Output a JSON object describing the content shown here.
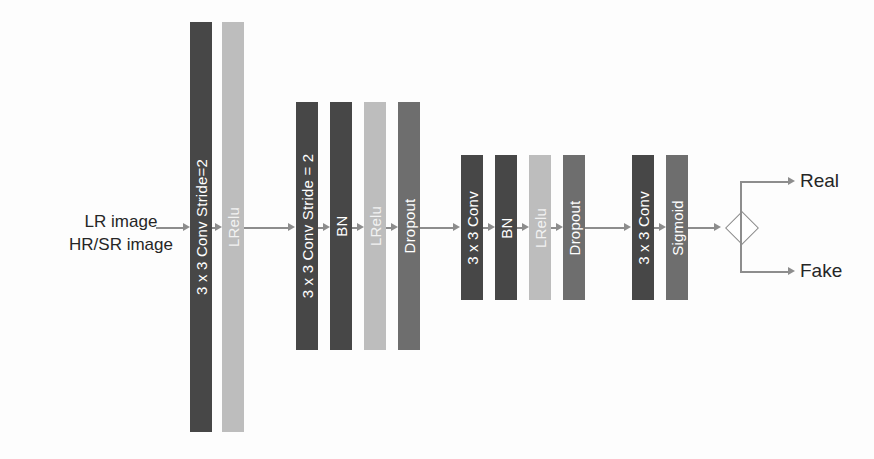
{
  "diagram": {
    "input": {
      "line1": "LR image",
      "line2": "HR/SR image"
    },
    "groups": [
      {
        "name": "group-1",
        "layers": [
          {
            "label": "3 x 3 Conv Stride=2",
            "tone": "dark",
            "color": "#474747",
            "x": 190,
            "y": 22,
            "w": 22,
            "h": 410
          },
          {
            "label": "LRelu",
            "tone": "light",
            "color": "#bdbdbd",
            "x": 222,
            "y": 22,
            "w": 22,
            "h": 410
          }
        ]
      },
      {
        "name": "group-2",
        "layers": [
          {
            "label": "3 x 3 Conv Stride = 2",
            "tone": "dark",
            "color": "#474747",
            "x": 296,
            "y": 102,
            "w": 22,
            "h": 248
          },
          {
            "label": "BN",
            "tone": "dark",
            "color": "#474747",
            "x": 330,
            "y": 102,
            "w": 22,
            "h": 248
          },
          {
            "label": "LRelu",
            "tone": "light",
            "color": "#bdbdbd",
            "x": 364,
            "y": 102,
            "w": 22,
            "h": 248
          },
          {
            "label": "Dropout",
            "tone": "mid",
            "color": "#6e6e6e",
            "x": 398,
            "y": 102,
            "w": 22,
            "h": 248
          }
        ]
      },
      {
        "name": "group-3",
        "layers": [
          {
            "label": "3 x 3 Conv",
            "tone": "dark",
            "color": "#474747",
            "x": 461,
            "y": 155,
            "w": 22,
            "h": 145
          },
          {
            "label": "BN",
            "tone": "dark",
            "color": "#474747",
            "x": 495,
            "y": 155,
            "w": 22,
            "h": 145
          },
          {
            "label": "LRelu",
            "tone": "light",
            "color": "#bdbdbd",
            "x": 529,
            "y": 155,
            "w": 22,
            "h": 145
          },
          {
            "label": "Dropout",
            "tone": "mid",
            "color": "#6e6e6e",
            "x": 563,
            "y": 155,
            "w": 22,
            "h": 145
          }
        ]
      },
      {
        "name": "group-4",
        "layers": [
          {
            "label": "3 x 3 Conv",
            "tone": "dark",
            "color": "#474747",
            "x": 632,
            "y": 155,
            "w": 22,
            "h": 145
          },
          {
            "label": "Sigmoid",
            "tone": "mid",
            "color": "#6e6e6e",
            "x": 666,
            "y": 155,
            "w": 22,
            "h": 145
          }
        ]
      }
    ],
    "decision": {
      "name": "real-fake-decision"
    },
    "outputs": [
      {
        "label": "Real",
        "x": 800,
        "y": 170
      },
      {
        "label": "Fake",
        "x": 800,
        "y": 252
      }
    ],
    "colors": {
      "dark": "#474747",
      "mid": "#6e6e6e",
      "light": "#bdbdbd",
      "connector": "#8d8d8d",
      "text": "#262626",
      "background": "#fdfdfd"
    }
  }
}
